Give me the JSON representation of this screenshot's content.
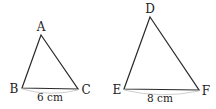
{
  "triangles": [
    {
      "name": "ABC",
      "vertices": {
        "A": "A",
        "B": "B",
        "C": "C"
      },
      "base_label": "6 cm"
    },
    {
      "name": "DEF",
      "vertices": {
        "D": "D",
        "E": "E",
        "F": "F"
      },
      "base_label": "8 cm"
    }
  ],
  "colors": {
    "stroke": "#2a2a2a",
    "brace": "#c8c8c8",
    "text": "#222222"
  }
}
